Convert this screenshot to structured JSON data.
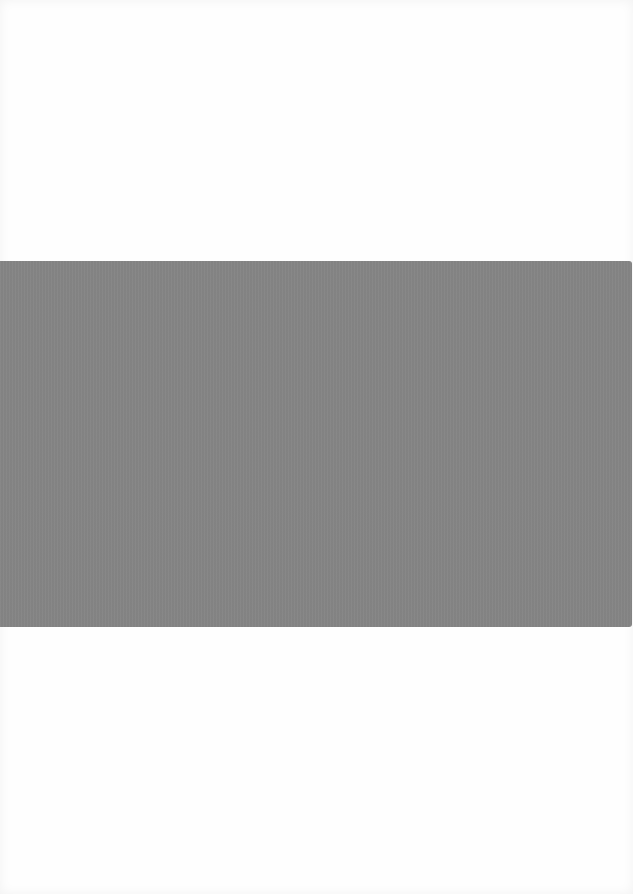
{
  "document": {
    "type": "scanned-page",
    "regions": [
      {
        "name": "top-blank",
        "content": ""
      },
      {
        "name": "gray-band",
        "content": "",
        "color": "#858585"
      },
      {
        "name": "bottom-blank",
        "content": ""
      }
    ],
    "colors": {
      "paper": "#fefefe",
      "band": "#858585"
    }
  }
}
